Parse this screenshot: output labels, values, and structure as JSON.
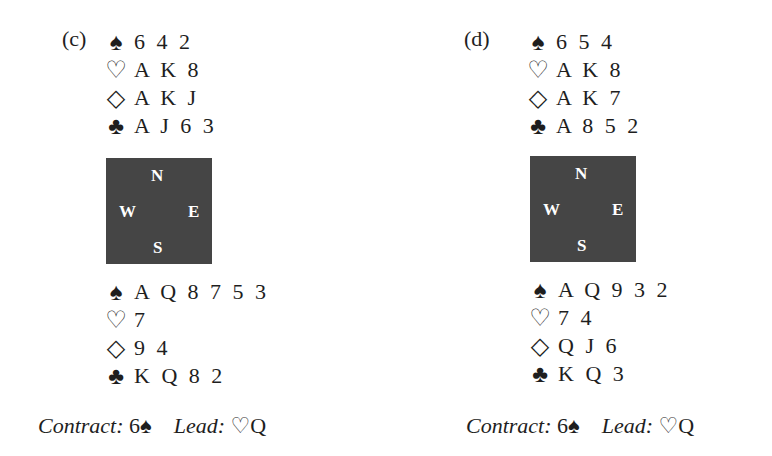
{
  "problems": [
    {
      "label": "(c)",
      "north": {
        "spades": {
          "symbol": "♠",
          "cards": "6 4 2"
        },
        "hearts": {
          "symbol": "♡",
          "cards": "A K 8"
        },
        "diamonds": {
          "symbol": "◇",
          "cards": "A K J"
        },
        "clubs": {
          "symbol": "♣",
          "cards": "A J 6 3"
        }
      },
      "compass": {
        "n": "N",
        "w": "W",
        "e": "E",
        "s": "S"
      },
      "south": {
        "spades": {
          "symbol": "♠",
          "cards": "A Q 8 7 5 3"
        },
        "hearts": {
          "symbol": "♡",
          "cards": "7"
        },
        "diamonds": {
          "symbol": "◇",
          "cards": "9 4"
        },
        "clubs": {
          "symbol": "♣",
          "cards": "K Q 8 2"
        }
      },
      "contract_label": "Contract:",
      "contract_level": "6",
      "contract_suit": "♠",
      "lead_label": "Lead:",
      "lead_suit": "♡",
      "lead_card": "Q"
    },
    {
      "label": "(d)",
      "north": {
        "spades": {
          "symbol": "♠",
          "cards": "6 5 4"
        },
        "hearts": {
          "symbol": "♡",
          "cards": "A K 8"
        },
        "diamonds": {
          "symbol": "◇",
          "cards": "A K 7"
        },
        "clubs": {
          "symbol": "♣",
          "cards": "A 8 5 2"
        }
      },
      "compass": {
        "n": "N",
        "w": "W",
        "e": "E",
        "s": "S"
      },
      "south": {
        "spades": {
          "symbol": "♠",
          "cards": "A Q 9 3 2"
        },
        "hearts": {
          "symbol": "♡",
          "cards": "7 4"
        },
        "diamonds": {
          "symbol": "◇",
          "cards": "Q J 6"
        },
        "clubs": {
          "symbol": "♣",
          "cards": "K Q 3"
        }
      },
      "contract_label": "Contract:",
      "contract_level": "6",
      "contract_suit": "♠",
      "lead_label": "Lead:",
      "lead_suit": "♡",
      "lead_card": "Q"
    }
  ]
}
